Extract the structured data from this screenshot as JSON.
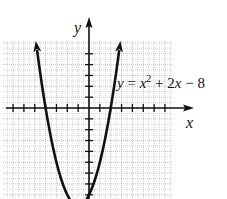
{
  "chart_data": {
    "type": "line",
    "title": "",
    "equation_label": "y = x² + 2x − 8",
    "equation_parts": {
      "y": "y",
      "eq": " = ",
      "x": "x",
      "exp": "2",
      "rest": " + 2",
      "x2": "x",
      "tail": " − 8"
    },
    "xlabel": "x",
    "ylabel": "y",
    "function": "x^2 + 2x - 8",
    "xlim": [
      -8,
      8
    ],
    "ylim": [
      -9,
      6
    ],
    "grid": true,
    "grid_minor_step": 0.5,
    "x_ticks": [
      -7,
      -6,
      -5,
      -4,
      -3,
      -2,
      -1,
      1,
      2,
      3,
      4,
      5,
      6,
      7
    ],
    "y_ticks": [
      -8,
      -7,
      -6,
      -5,
      -4,
      -3,
      -2,
      -1,
      1,
      2,
      3,
      4,
      5
    ],
    "x_intercepts": [
      -4,
      2
    ],
    "y_intercept": -8,
    "vertex": [
      -1,
      -9
    ],
    "series": [
      {
        "name": "y = x^2 + 2x - 8",
        "x": [
          -5.8,
          -5,
          -4,
          -3,
          -2,
          -1,
          0,
          1,
          2,
          3,
          3.8
        ],
        "y": [
          1.04,
          7,
          0,
          -5,
          -8,
          -9,
          -8,
          -5,
          0,
          7,
          1.04
        ]
      }
    ],
    "arrows": [
      "curve-left-up",
      "curve-right-up",
      "x-axis-positive",
      "y-axis-positive"
    ]
  },
  "colors": {
    "curve": "#111111",
    "axis": "#111111",
    "grid": "#b0b0b0",
    "background": "#ffffff"
  }
}
